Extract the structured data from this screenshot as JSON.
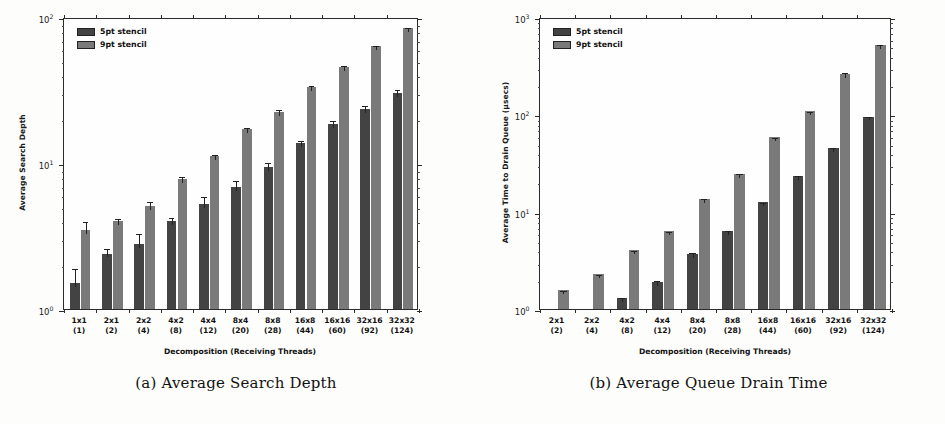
{
  "figure": {
    "panels": [
      {
        "id": "panel-a",
        "caption": "(a) Average Search Depth",
        "legend": [
          {
            "key": "s5",
            "label": "5pt stencil",
            "color": "#434343"
          },
          {
            "key": "s9",
            "label": "9pt stencil",
            "color": "#7a7a7a"
          }
        ]
      },
      {
        "id": "panel-b",
        "caption": "(b) Average Queue Drain Time",
        "legend": [
          {
            "key": "s5",
            "label": "5pt stencil",
            "color": "#434343"
          },
          {
            "key": "s9",
            "label": "9pt stencil",
            "color": "#7a7a7a"
          }
        ]
      }
    ]
  },
  "chart_data": [
    {
      "type": "bar",
      "title": "(a) Average Search Depth",
      "xlabel": "Decomposition (Receiving Threads)",
      "ylabel": "Average Search Depth",
      "yscale": "log",
      "ylim": [
        1,
        100
      ],
      "yticks": [
        1,
        10,
        100
      ],
      "ytick_labels": [
        "10^0",
        "10^1",
        "10^2"
      ],
      "grid": false,
      "legend_position": "upper left",
      "categories": [
        "1x1",
        "2x1",
        "2x2",
        "4x2",
        "4x4",
        "8x4",
        "8x8",
        "16x8",
        "16x16",
        "32x16",
        "32x32"
      ],
      "category_sublabels": [
        "(1)",
        "(2)",
        "(4)",
        "(8)",
        "(12)",
        "(20)",
        "(28)",
        "(44)",
        "(60)",
        "(92)",
        "(124)"
      ],
      "series": [
        {
          "name": "5pt stencil",
          "color": "#434343",
          "values": [
            1.5,
            2.4,
            2.8,
            4.0,
            5.2,
            6.9,
            9.4,
            13.8,
            18.5,
            23.5,
            30.0
          ],
          "errors": [
            0.45,
            0.25,
            0.55,
            0.35,
            0.8,
            0.9,
            1.0,
            0.9,
            1.6,
            2.0,
            2.5
          ]
        },
        {
          "name": "9pt stencil",
          "color": "#7a7a7a",
          "values": [
            3.5,
            4.0,
            5.1,
            7.8,
            11.2,
            17.0,
            22.5,
            33.0,
            45.5,
            63.0,
            84.0
          ],
          "errors": [
            0.55,
            0.25,
            0.45,
            0.45,
            0.5,
            1.0,
            1.3,
            1.5,
            2.0,
            2.5,
            3.0
          ]
        }
      ]
    },
    {
      "type": "bar",
      "title": "(b) Average Queue Drain Time",
      "xlabel": "Decomposition (Receiving Threads)",
      "ylabel": "Average Time to Drain Queue (μsecs)",
      "yscale": "log",
      "ylim": [
        1,
        1000
      ],
      "yticks": [
        1,
        10,
        100,
        1000
      ],
      "ytick_labels": [
        "10^0",
        "10^1",
        "10^2",
        "10^3"
      ],
      "grid": false,
      "legend_position": "upper left",
      "categories": [
        "2x1",
        "2x2",
        "4x2",
        "4x4",
        "8x4",
        "8x8",
        "16x8",
        "16x16",
        "32x16",
        "32x32"
      ],
      "category_sublabels": [
        "(2)",
        "(4)",
        "(8)",
        "(12)",
        "(20)",
        "(28)",
        "(44)",
        "(60)",
        "(92)",
        "(124)"
      ],
      "series": [
        {
          "name": "5pt stencil",
          "color": "#434343",
          "values": [
            null,
            null,
            1.3,
            1.9,
            3.7,
            6.3,
            12.5,
            23.5,
            45.0,
            95.0
          ],
          "errors": [
            null,
            null,
            0.07,
            0.12,
            0.2,
            0.3,
            0.5,
            0.9,
            2.0,
            3.0
          ]
        },
        {
          "name": "9pt stencil",
          "color": "#7a7a7a",
          "values": [
            1.55,
            2.3,
            4.0,
            6.3,
            13.5,
            24.5,
            58.0,
            108.0,
            260.0,
            520.0
          ],
          "errors": [
            0.05,
            0.07,
            0.1,
            0.2,
            0.5,
            0.8,
            2.0,
            4.0,
            22.0,
            20.0
          ]
        }
      ]
    }
  ],
  "axis_titles": {
    "x": "Decomposition (Receiving Threads)"
  }
}
